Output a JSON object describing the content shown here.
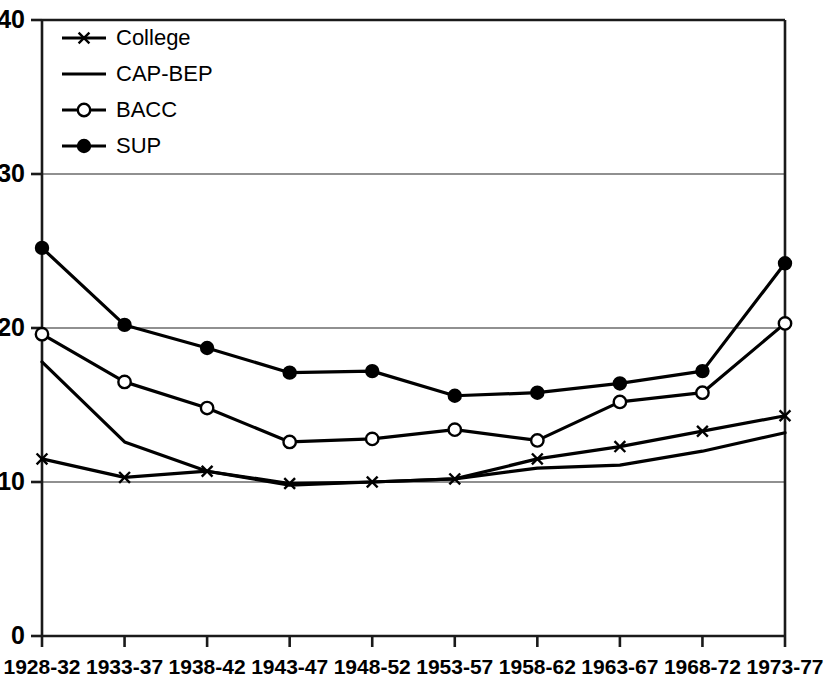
{
  "chart_data": {
    "type": "line",
    "title": "",
    "subtitle": "",
    "xlabel": "",
    "ylabel": "",
    "categories": [
      "1928-32",
      "1933-37",
      "1938-42",
      "1943-47",
      "1948-52",
      "1953-57",
      "1958-62",
      "1963-67",
      "1968-72",
      "1973-77"
    ],
    "ylim": [
      0,
      40
    ],
    "yticks": [
      0,
      10,
      20,
      30,
      40
    ],
    "grid": "horizontal",
    "legend_position": "top-left",
    "series": [
      {
        "name": "College",
        "marker": "x",
        "marker_fill": "none",
        "color": "#000000",
        "values": [
          11.5,
          10.3,
          10.7,
          9.9,
          10.0,
          10.2,
          11.5,
          12.3,
          13.3,
          14.3
        ]
      },
      {
        "name": "CAP-BEP",
        "marker": "none",
        "marker_fill": "none",
        "color": "#000000",
        "values": [
          17.8,
          12.6,
          10.7,
          9.8,
          10.0,
          10.2,
          10.9,
          11.1,
          12.0,
          13.2
        ]
      },
      {
        "name": "BACC",
        "marker": "circle-open",
        "marker_fill": "#ffffff",
        "color": "#000000",
        "values": [
          19.6,
          16.5,
          14.8,
          12.6,
          12.8,
          13.4,
          12.7,
          15.2,
          15.8,
          20.3
        ]
      },
      {
        "name": "SUP",
        "marker": "circle-filled",
        "marker_fill": "#000000",
        "color": "#000000",
        "values": [
          25.2,
          20.2,
          18.7,
          17.1,
          17.2,
          15.6,
          15.8,
          16.4,
          17.2,
          24.2
        ]
      }
    ]
  },
  "legend": {
    "items": [
      {
        "label": "College"
      },
      {
        "label": "CAP-BEP"
      },
      {
        "label": "BACC"
      },
      {
        "label": "SUP"
      }
    ]
  },
  "colors": {
    "line": "#1a1a1a",
    "grid": "#6b6b6b",
    "axis": "#1a1a1a",
    "background": "#ffffff"
  }
}
